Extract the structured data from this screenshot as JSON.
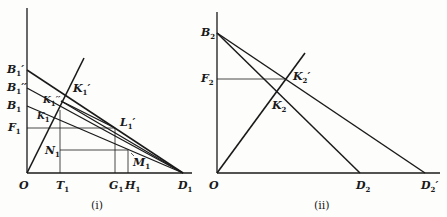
{
  "panels": [
    {
      "caption": "(i)",
      "labels": {
        "B1p": "B",
        "B1pp": "B",
        "B1": "B",
        "F1": "F",
        "O": "O",
        "T1": "T",
        "G1": "G",
        "H1": "H",
        "D1": "D",
        "K1p": "K",
        "K1pp": "K",
        "K1": "K",
        "L1p": "L",
        "N1": "N",
        "M1": "M"
      },
      "subscripts": {
        "one": "1",
        "primes_single": "′",
        "primes_double": "′′"
      }
    },
    {
      "caption": "(ii)",
      "labels": {
        "B2": "B",
        "F2": "F",
        "O": "O",
        "K2p": "K",
        "K2": "K",
        "D2": "D",
        "D2p": "D"
      },
      "subscripts": {
        "two": "2",
        "primes_single": "′"
      }
    }
  ],
  "colors": {
    "line": "#1a1a1a",
    "background": "#fdfdfc"
  }
}
